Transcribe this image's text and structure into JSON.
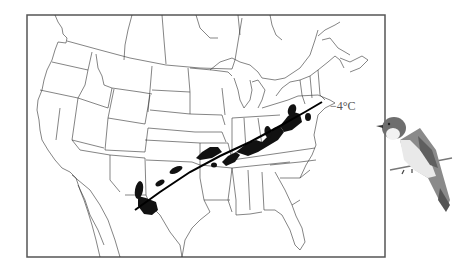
{
  "figure": {
    "type": "range-map",
    "isotherm_label": "−4°C",
    "map_region": "North America (United States, southern Canada, northern Mexico)",
    "elements": {
      "isotherm_line": "−4°C mean minimum January temperature isotherm",
      "range_boundary": "black shaded northern range limit",
      "illustration": "perched flycatcher bird"
    },
    "colors": {
      "background": "#ffffff",
      "frame": "#555555",
      "borders": "#333333",
      "range_fill": "#111111",
      "isotherm": "#000000",
      "label": "#555555"
    }
  }
}
